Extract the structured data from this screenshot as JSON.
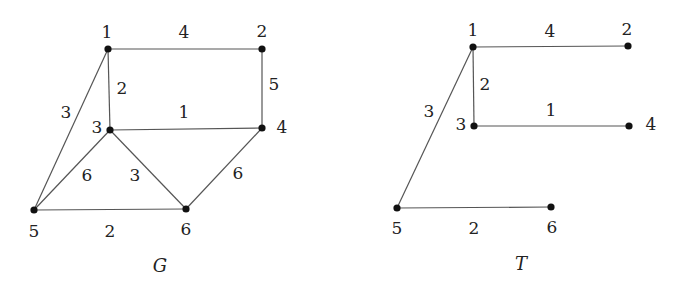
{
  "graphs": [
    {
      "caption": "G",
      "caption_pos": [
        160,
        267
      ],
      "nodes": [
        {
          "id": "1",
          "x": 108,
          "y": 49,
          "lx": 107,
          "ly": 33
        },
        {
          "id": "2",
          "x": 262,
          "y": 49,
          "lx": 262,
          "ly": 32
        },
        {
          "id": "3",
          "x": 110,
          "y": 130,
          "lx": 97,
          "ly": 128
        },
        {
          "id": "4",
          "x": 262,
          "y": 128,
          "lx": 282,
          "ly": 128
        },
        {
          "id": "5",
          "x": 34,
          "y": 210,
          "lx": 34,
          "ly": 232
        },
        {
          "id": "6",
          "x": 186,
          "y": 209,
          "lx": 186,
          "ly": 230
        }
      ],
      "edges": [
        {
          "from": "1",
          "to": "2",
          "weight": "4",
          "wx": 184,
          "wy": 33
        },
        {
          "from": "2",
          "to": "4",
          "weight": "5",
          "wx": 274,
          "wy": 85
        },
        {
          "from": "1",
          "to": "3",
          "weight": "2",
          "wx": 122,
          "wy": 89
        },
        {
          "from": "3",
          "to": "4",
          "weight": "1",
          "wx": 184,
          "wy": 113
        },
        {
          "from": "1",
          "to": "5",
          "weight": "3",
          "wx": 66,
          "wy": 113
        },
        {
          "from": "3",
          "to": "5",
          "weight": "6",
          "wx": 87,
          "wy": 176
        },
        {
          "from": "3",
          "to": "6",
          "weight": "3",
          "wx": 135,
          "wy": 176
        },
        {
          "from": "4",
          "to": "6",
          "weight": "6",
          "wx": 238,
          "wy": 174
        },
        {
          "from": "5",
          "to": "6",
          "weight": "2",
          "wx": 110,
          "wy": 232
        }
      ]
    },
    {
      "caption": "T",
      "caption_pos": [
        521,
        265
      ],
      "nodes": [
        {
          "id": "1",
          "x": 473,
          "y": 47,
          "lx": 473,
          "ly": 31
        },
        {
          "id": "2",
          "x": 628,
          "y": 46,
          "lx": 627,
          "ly": 30
        },
        {
          "id": "3",
          "x": 474,
          "y": 126,
          "lx": 461,
          "ly": 125
        },
        {
          "id": "4",
          "x": 629,
          "y": 126,
          "lx": 651,
          "ly": 125
        },
        {
          "id": "5",
          "x": 397,
          "y": 208,
          "lx": 397,
          "ly": 229
        },
        {
          "id": "6",
          "x": 551,
          "y": 207,
          "lx": 552,
          "ly": 228
        }
      ],
      "edges": [
        {
          "from": "1",
          "to": "2",
          "weight": "4",
          "wx": 550,
          "wy": 32
        },
        {
          "from": "1",
          "to": "3",
          "weight": "2",
          "wx": 485,
          "wy": 85
        },
        {
          "from": "3",
          "to": "4",
          "weight": "1",
          "wx": 551,
          "wy": 111
        },
        {
          "from": "1",
          "to": "5",
          "weight": "3",
          "wx": 429,
          "wy": 112
        },
        {
          "from": "5",
          "to": "6",
          "weight": "2",
          "wx": 474,
          "wy": 229
        }
      ]
    }
  ]
}
